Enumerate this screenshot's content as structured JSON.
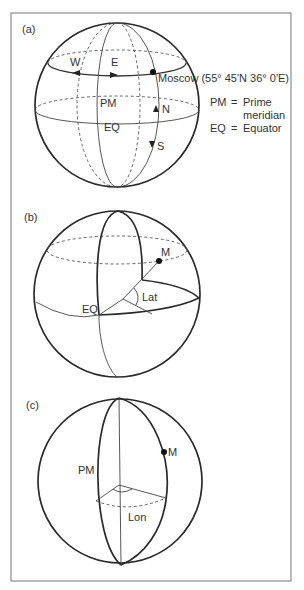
{
  "figure": {
    "panels": [
      {
        "id": "a",
        "label": "(a)",
        "labels": {
          "west": "W",
          "east": "E",
          "city": "Moscow (55° 45'N 36° 0'E)",
          "prime_meridian": "PM",
          "equator": "EQ",
          "north": "N",
          "south": "S"
        },
        "legend": [
          {
            "abbr": "PM",
            "eq": "=",
            "line1": "Prime",
            "line2": "meridian"
          },
          {
            "abbr": "EQ",
            "eq": "=",
            "line1": "Equator"
          }
        ]
      },
      {
        "id": "b",
        "label": "(b)",
        "labels": {
          "point": "M",
          "latitude": "Lat",
          "equator": "EQ"
        }
      },
      {
        "id": "c",
        "label": "(c)",
        "labels": {
          "point": "M",
          "prime_meridian": "PM",
          "longitude": "Lon"
        }
      }
    ],
    "colors": {
      "stroke": "#2a2a2a",
      "frame": "#777777",
      "background": "#ffffff"
    }
  }
}
